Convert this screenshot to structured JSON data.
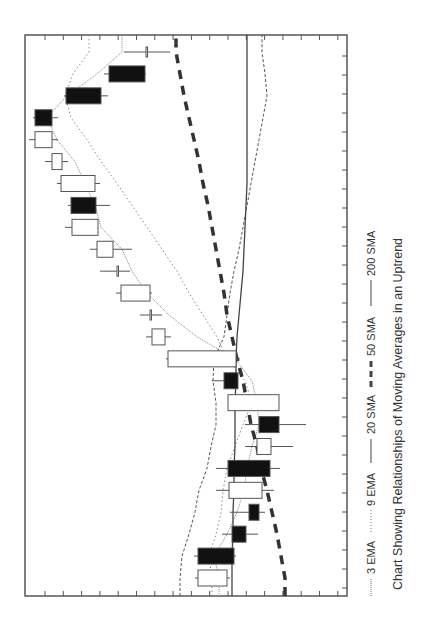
{
  "chart_data": {
    "type": "candlestick",
    "orientation": "rotated 90deg clockwise (time runs bottom-to-top, price increases to the left)",
    "title": "Chart Showing Relationships of Moving Averages in an Uptrend",
    "xlabel": "",
    "ylabel": "",
    "grid": false,
    "legend_position": "right (rotated, below plot)",
    "legend": [
      {
        "name": "3 EMA",
        "style": "fine dotted"
      },
      {
        "name": "9 EMA",
        "style": "dotted"
      },
      {
        "name": "20 SMA",
        "style": "thin dashed"
      },
      {
        "name": "50 SMA",
        "style": "thick dashed"
      },
      {
        "name": "200 SMA",
        "style": "solid"
      }
    ],
    "price_scale_note": "no numeric tick labels shown; prices are relative units (0 = plot edge nearest legend, higher = further left on screen)",
    "candles": [
      {
        "t": 1,
        "open": 120,
        "close": 149,
        "low": 117,
        "high": 152,
        "filled": false
      },
      {
        "t": 2,
        "open": 149,
        "close": 113,
        "low": 111,
        "high": 153,
        "filled": true
      },
      {
        "t": 3,
        "open": 115,
        "close": 101,
        "low": 89,
        "high": 125,
        "filled": true
      },
      {
        "t": 4,
        "open": 98,
        "close": 88,
        "low": 82,
        "high": 117,
        "filled": true
      },
      {
        "t": 5,
        "open": 85,
        "close": 118,
        "low": 73,
        "high": 131,
        "filled": false
      },
      {
        "t": 6,
        "open": 119,
        "close": 77,
        "low": 67,
        "high": 131,
        "filled": true
      },
      {
        "t": 7,
        "open": 76,
        "close": 90,
        "low": 54,
        "high": 102,
        "filled": false
      },
      {
        "t": 8,
        "open": 88,
        "close": 68,
        "low": 41,
        "high": 102,
        "filled": true
      },
      {
        "t": 9,
        "open": 68,
        "close": 119,
        "low": 68,
        "high": 119,
        "filled": false
      },
      {
        "t": 10,
        "open": 123,
        "close": 109,
        "low": 109,
        "high": 135,
        "filled": true
      },
      {
        "t": 11,
        "open": 111,
        "close": 179,
        "low": 107,
        "high": 181,
        "filled": false
      },
      {
        "t": 12,
        "open": 182,
        "close": 195,
        "low": 176,
        "high": 201,
        "filled": false
      },
      {
        "t": 13,
        "open": 197,
        "close": 197,
        "low": 185,
        "high": 207,
        "filled": false
      },
      {
        "t": 14,
        "open": 197,
        "close": 226,
        "low": 195,
        "high": 231,
        "filled": false
      },
      {
        "t": 15,
        "open": 230,
        "close": 230,
        "low": 217,
        "high": 247,
        "filled": false
      },
      {
        "t": 16,
        "open": 234,
        "close": 250,
        "low": 215,
        "high": 257,
        "filled": false
      },
      {
        "t": 17,
        "open": 249,
        "close": 275,
        "low": 249,
        "high": 282,
        "filled": false
      },
      {
        "t": 18,
        "open": 276,
        "close": 251,
        "low": 237,
        "high": 279,
        "filled": true
      },
      {
        "t": 19,
        "open": 252,
        "close": 286,
        "low": 247,
        "high": 290,
        "filled": false
      },
      {
        "t": 20,
        "open": 285,
        "close": 295,
        "low": 279,
        "high": 302,
        "filled": false
      },
      {
        "t": 21,
        "open": 295,
        "close": 312,
        "low": 289,
        "high": 318,
        "filled": false
      },
      {
        "t": 22,
        "open": 312,
        "close": 295,
        "low": 289,
        "high": 314,
        "filled": true
      },
      {
        "t": 23,
        "open": 281,
        "close": 246,
        "low": 239,
        "high": 283,
        "filled": true
      },
      {
        "t": 24,
        "open": 238,
        "close": 202,
        "low": 201,
        "high": 243,
        "filled": true
      },
      {
        "t": 25,
        "open": 201,
        "close": 201,
        "low": 177,
        "high": 223,
        "filled": false
      }
    ],
    "series": [
      {
        "name": "3 EMA",
        "values": [
          128,
          133,
          120,
          110,
          103,
          100,
          95,
          88,
          90,
          95,
          112,
          150,
          178,
          200,
          215,
          225,
          246,
          252,
          262,
          272,
          290,
          300,
          280,
          250,
          225
        ]
      },
      {
        "name": "9 EMA",
        "values": [
          135,
          138,
          131,
          126,
          124,
          120,
          112,
          104,
          95,
          102,
          120,
          130,
          144,
          158,
          170,
          185,
          200,
          215,
          230,
          246,
          260,
          276,
          282,
          274,
          258
        ]
      },
      {
        "name": "20 SMA",
        "values": [
          167,
          165,
          158,
          152,
          148,
          140,
          136,
          131,
          131,
          134,
          133,
          123,
          120,
          117,
          113,
          108,
          104,
          100,
          96,
          92,
          88,
          84,
          80,
          82,
          85
        ]
      },
      {
        "name": "50 SMA",
        "values": [
          62,
          66,
          70,
          75,
          80,
          86,
          90,
          96,
          100,
          104,
          110,
          115,
          120,
          123,
          127,
          131,
          135,
          139,
          144,
          148,
          153,
          158,
          163,
          167,
          171
        ]
      },
      {
        "name": "200 SMA",
        "values": [
          115,
          115,
          114,
          114,
          113,
          113,
          112,
          112,
          112,
          111,
          111,
          110,
          108,
          106,
          104,
          103,
          102,
          101,
          100,
          100,
          100,
          100,
          100,
          100,
          100
        ]
      }
    ]
  },
  "legend_labels": {
    "ema3": "3 EMA",
    "ema9": "9 EMA",
    "sma20": "20 SMA",
    "sma50": "50 SMA",
    "sma200": "200 SMA"
  },
  "caption": "Chart Showing Relationships of Moving Averages in an Uptrend"
}
